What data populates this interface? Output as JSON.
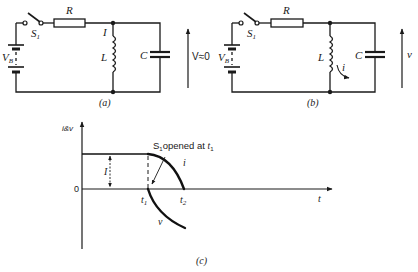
{
  "figure": {
    "panel_a": {
      "caption": "(a)",
      "labels": {
        "resistor": "R",
        "switch": "S",
        "switch_sub": "1",
        "battery": "V",
        "battery_sub": "B",
        "current": "I",
        "inductor": "L",
        "capacitor": "C",
        "voltage": "V≈0"
      }
    },
    "panel_b": {
      "caption": "(b)",
      "labels": {
        "resistor": "R",
        "switch": "S",
        "switch_sub": "1",
        "battery": "V",
        "battery_sub": "B",
        "current": "i",
        "inductor": "L",
        "capacitor": "C",
        "voltage": "v"
      }
    },
    "panel_c": {
      "caption": "(c)",
      "y_axis_label": "i&v",
      "x_axis_label": "t",
      "origin_label": "0",
      "level_label": "I",
      "t1_label": "t",
      "t1_sub": "1",
      "t2_label": "t",
      "t2_sub": "2",
      "annotation": "S",
      "annotation_sub": "1",
      "annotation_rest": "opened at ",
      "annotation_t": "t",
      "annotation_t_sub": "1",
      "curve_i_label": "i",
      "curve_v_label": "v"
    }
  }
}
